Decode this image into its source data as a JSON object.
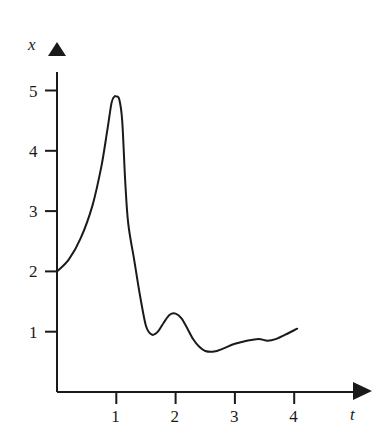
{
  "chart_data": {
    "type": "line",
    "title": "",
    "xlabel": "t",
    "ylabel": "x",
    "xlim": [
      0,
      4.5
    ],
    "ylim": [
      0,
      5.5
    ],
    "xticks": [
      1,
      2,
      3,
      4
    ],
    "yticks": [
      1,
      2,
      3,
      4,
      5
    ],
    "grid": false,
    "legend": null,
    "series": [
      {
        "name": "x(t)",
        "x": [
          0,
          0.2,
          0.4,
          0.6,
          0.75,
          0.85,
          0.92,
          0.97,
          1.0,
          1.05,
          1.1,
          1.15,
          1.2,
          1.3,
          1.4,
          1.5,
          1.6,
          1.7,
          1.8,
          1.9,
          2.0,
          2.1,
          2.2,
          2.3,
          2.4,
          2.5,
          2.65,
          2.8,
          3.0,
          3.2,
          3.4,
          3.55,
          3.7,
          3.85,
          4.05
        ],
        "values": [
          2.0,
          2.2,
          2.55,
          3.1,
          3.75,
          4.35,
          4.8,
          4.9,
          4.9,
          4.85,
          4.5,
          3.5,
          2.8,
          2.2,
          1.6,
          1.1,
          0.95,
          1.0,
          1.15,
          1.28,
          1.3,
          1.22,
          1.05,
          0.87,
          0.75,
          0.68,
          0.67,
          0.72,
          0.8,
          0.85,
          0.88,
          0.85,
          0.88,
          0.95,
          1.05
        ]
      }
    ]
  },
  "labels": {
    "x_axis": "t",
    "y_axis": "x",
    "xtick_labels": [
      "1",
      "2",
      "3",
      "4"
    ],
    "ytick_labels": [
      "1",
      "2",
      "3",
      "4",
      "5"
    ]
  },
  "colors": {
    "line": "#1a1a1a",
    "axis": "#1a1a1a",
    "background": "#ffffff"
  }
}
